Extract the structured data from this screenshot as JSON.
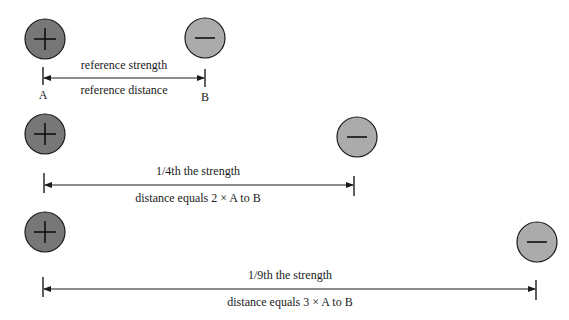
{
  "colors": {
    "positive_fill": "#777777",
    "negative_fill": "#ababab",
    "stroke": "#1a1a1a",
    "background": "#ffffff"
  },
  "rows": [
    {
      "positive_charge": {
        "symbol": "+",
        "label": "A"
      },
      "negative_charge": {
        "symbol": "−",
        "label": "B"
      },
      "strength_label": "reference strength",
      "distance_label": "reference distance"
    },
    {
      "positive_charge": {
        "symbol": "+"
      },
      "negative_charge": {
        "symbol": "−"
      },
      "strength_label": "1/4th the strength",
      "distance_label": "distance equals 2 × A to B"
    },
    {
      "positive_charge": {
        "symbol": "+"
      },
      "negative_charge": {
        "symbol": "−"
      },
      "strength_label": "1/9th the strength",
      "distance_label": "distance equals 3 × A to B"
    }
  ]
}
